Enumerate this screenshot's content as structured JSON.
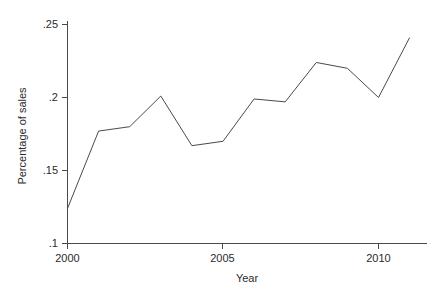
{
  "chart_data": {
    "type": "line",
    "title": "",
    "xlabel": "Year",
    "ylabel": "Percentage of sales",
    "x": [
      2000,
      2001,
      2002,
      2003,
      2004,
      2005,
      2006,
      2007,
      2008,
      2009,
      2010,
      2011
    ],
    "values": [
      0.124,
      0.177,
      0.18,
      0.201,
      0.167,
      0.17,
      0.199,
      0.197,
      0.224,
      0.22,
      0.2,
      0.241
    ],
    "series": [
      {
        "name": "Percentage of sales",
        "values": [
          0.124,
          0.177,
          0.18,
          0.201,
          0.167,
          0.17,
          0.199,
          0.197,
          0.224,
          0.22,
          0.2,
          0.241
        ]
      }
    ],
    "xlim": [
      1999.6,
      2011.4
    ],
    "ylim": [
      0.1,
      0.25
    ],
    "xticks": [
      2000,
      2005,
      2010
    ],
    "xtick_labels": [
      "2000",
      "2005",
      "2010"
    ],
    "yticks": [
      0.1,
      0.15,
      0.2,
      0.25
    ],
    "ytick_labels": [
      ".1",
      ".15",
      ".2",
      ".25"
    ],
    "grid": false,
    "legend": false,
    "legend_position": "none",
    "line_color": "#4a4a4a",
    "background_color": "#ffffff"
  },
  "axes": {
    "y_title": "Percentage of sales",
    "x_title": "Year",
    "y_tick_labels": [
      ".25",
      ".2",
      ".15",
      ".1"
    ],
    "x_tick_labels": [
      "2000",
      "2005",
      "2010"
    ]
  }
}
